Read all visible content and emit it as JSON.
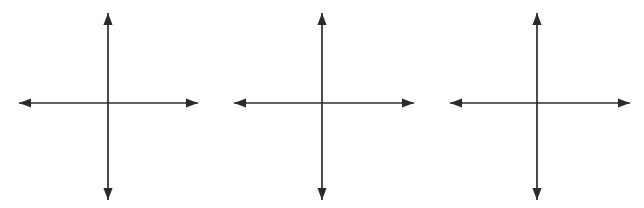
{
  "figure": {
    "title": "Three blank Cartesian coordinate planes",
    "background_color": "#ffffff",
    "canvas": {
      "width": 644,
      "height": 208
    }
  },
  "style": {
    "line_color": "#2b2b2b",
    "line_width": 1.7,
    "arrow_fill": "#2b2b2b",
    "arrow_half_width": 4.6,
    "arrow_length": 12
  },
  "chart_data": {
    "type": "scatter",
    "title": "Three blank Cartesian coordinate planes",
    "subtitle": "",
    "xlabel": "",
    "ylabel": "",
    "grid": false,
    "legend": null,
    "annotations": [],
    "x": [],
    "series": [],
    "panels": [
      {
        "id": "panel-1",
        "name": "coordinate-plane-1",
        "label": "",
        "center": {
          "x": 108,
          "y": 103
        },
        "x_axis": {
          "start_x": 19,
          "end_x": 198,
          "y": 103,
          "arrow_start": true,
          "arrow_end": true
        },
        "y_axis": {
          "start_y": 200,
          "end_y": 13,
          "x": 108,
          "arrow_start": true,
          "arrow_end": true
        },
        "xlim": [
          -1,
          1
        ],
        "ylim": [
          -1,
          1
        ],
        "xticks": [],
        "yticks": [],
        "xtick_labels": [],
        "ytick_labels": [],
        "points": [],
        "quadrant_labels": []
      },
      {
        "id": "panel-2",
        "name": "coordinate-plane-2",
        "label": "",
        "center": {
          "x": 322,
          "y": 103
        },
        "x_axis": {
          "start_x": 234,
          "end_x": 414,
          "y": 103,
          "arrow_start": true,
          "arrow_end": true
        },
        "y_axis": {
          "start_y": 200,
          "end_y": 13,
          "x": 322,
          "arrow_start": true,
          "arrow_end": true
        },
        "xlim": [
          -1,
          1
        ],
        "ylim": [
          -1,
          1
        ],
        "xticks": [],
        "yticks": [],
        "xtick_labels": [],
        "ytick_labels": [],
        "points": [],
        "quadrant_labels": []
      },
      {
        "id": "panel-3",
        "name": "coordinate-plane-3",
        "label": "",
        "center": {
          "x": 537,
          "y": 103
        },
        "x_axis": {
          "start_x": 450,
          "end_x": 630,
          "y": 103,
          "arrow_start": true,
          "arrow_end": true
        },
        "y_axis": {
          "start_y": 200,
          "end_y": 13,
          "x": 537,
          "arrow_start": true,
          "arrow_end": true
        },
        "xlim": [
          -1,
          1
        ],
        "ylim": [
          -1,
          1
        ],
        "xticks": [],
        "yticks": [],
        "xtick_labels": [],
        "ytick_labels": [],
        "points": [],
        "quadrant_labels": []
      }
    ]
  }
}
